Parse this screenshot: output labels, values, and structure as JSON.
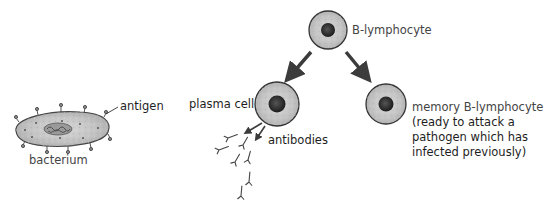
{
  "diagram": {
    "nodes": {
      "b_lymphocyte": {
        "label": "B-lymphocyte"
      },
      "plasma_cell": {
        "label": "plasma cell"
      },
      "memory_cell": {
        "label_line1": "memory B-lymphocyte",
        "label_line2": "(ready to attack a",
        "label_line3": "pathogen which has",
        "label_line4": "infected previously)"
      },
      "bacterium": {
        "label": "bacterium"
      },
      "antigen": {
        "label": "antigen"
      },
      "antibodies": {
        "label": "antibodies"
      }
    },
    "edges": [
      {
        "from": "B-lymphocyte",
        "to": "plasma cell"
      },
      {
        "from": "B-lymphocyte",
        "to": "memory B-lymphocyte"
      },
      {
        "from": "plasma cell",
        "to": "antibodies"
      }
    ],
    "colors": {
      "cell_fill": "#c8c8c8",
      "cell_outline": "#3a3a3a",
      "nucleus": "#2a2a2a",
      "arrow": "#3c3c3c"
    }
  }
}
